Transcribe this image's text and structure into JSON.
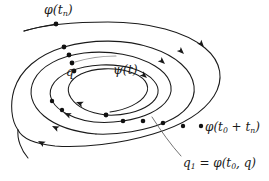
{
  "figure": {
    "kind": "hand-drawn-math-diagram",
    "background_color": "#ffffff",
    "stroke_color": "#1a1a1a",
    "faint_stroke_color": "#9a9a9a",
    "point_color": "#111111",
    "width": 269,
    "height": 181
  },
  "labels": {
    "phi_tn": {
      "prefix": "φ(t",
      "sub": "n",
      "suffix": ")"
    },
    "q": {
      "text": "q"
    },
    "psi_t": {
      "text": "ψ(t)"
    },
    "phi_t0_tn": {
      "prefix": "φ(t",
      "sub0": "0",
      "mid": " + t",
      "subn": "n",
      "suffix": ")"
    },
    "q1": {
      "lead": "q",
      "sub": "1",
      "eq": " = φ(t",
      "sub0": "0",
      "tail": ", q)"
    }
  },
  "markers": {
    "point_count_upper_left": 4,
    "point_count_lower_right": 5,
    "arrowhead_count_right": 4,
    "arrowhead_count_lower_left": 4
  }
}
